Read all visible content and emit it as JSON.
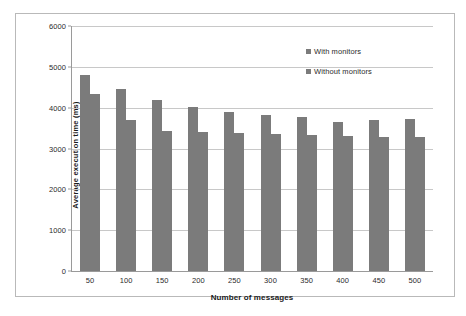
{
  "chart_data": {
    "type": "bar",
    "title": "",
    "xlabel": "Number of messages",
    "ylabel": "Average execution time (ms)",
    "categories": [
      "50",
      "100",
      "150",
      "200",
      "250",
      "300",
      "350",
      "400",
      "450",
      "500"
    ],
    "series": [
      {
        "name": "With monitors",
        "values": [
          4800,
          4450,
          4200,
          4020,
          3900,
          3830,
          3760,
          3660,
          3710,
          3730
        ]
      },
      {
        "name": "Without monitors",
        "values": [
          4330,
          3700,
          3420,
          3400,
          3370,
          3350,
          3330,
          3300,
          3280,
          3270
        ]
      }
    ],
    "ylim": [
      0,
      6000
    ],
    "yticks": [
      0,
      1000,
      2000,
      3000,
      4000,
      5000,
      6000
    ],
    "ytick_labels": [
      "0",
      "1000",
      "2000",
      "3000",
      "4000",
      "5000",
      "6000"
    ],
    "grid": true,
    "legend_position": "top-right",
    "bar_color": "#7b7b7b",
    "gridline_color": "#c8c8c8",
    "axis_color": "#9a9a9a",
    "frame_color": "#b9b9b9"
  }
}
